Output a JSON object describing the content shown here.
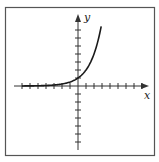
{
  "chart_data": {
    "type": "line",
    "title": "",
    "xlabel": "x",
    "ylabel": "y",
    "function": "y = 2^x",
    "grid": false,
    "legend": null,
    "xlim": [
      -7,
      8
    ],
    "ylim": [
      -8,
      9
    ],
    "x_ticks_unlabeled": [
      -7,
      -6,
      -5,
      -4,
      -3,
      -2,
      -1,
      1,
      2,
      3,
      4,
      5,
      6,
      7,
      8
    ],
    "y_ticks_unlabeled": [
      -7,
      -6,
      -5,
      -4,
      -3,
      -2,
      -1,
      1,
      2,
      3,
      4,
      5,
      6,
      7
    ],
    "series": [
      {
        "name": "exponential curve",
        "x": [
          -7,
          -6,
          -5,
          -4,
          -3,
          -2,
          -1,
          0,
          0.5,
          1,
          1.5,
          2,
          2.5,
          2.9
        ],
        "y": [
          0.01,
          0.02,
          0.03,
          0.06,
          0.13,
          0.25,
          0.5,
          1,
          1.41,
          2,
          2.83,
          4,
          5.66,
          7.46
        ]
      }
    ]
  },
  "labels": {
    "x_axis": "x",
    "y_axis": "y"
  },
  "colors": {
    "frame": "#555555",
    "axes": "#333333",
    "curve": "#1a1a1a"
  }
}
